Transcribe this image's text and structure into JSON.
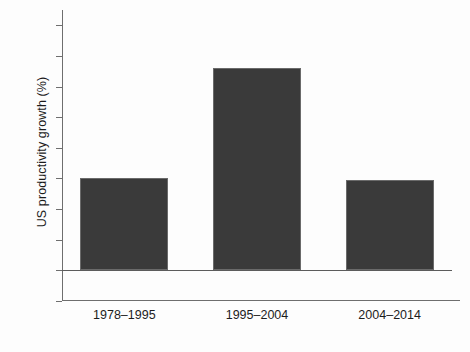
{
  "chart_data": {
    "type": "bar",
    "title": "",
    "subtitle": "",
    "xlabel": "",
    "ylabel": "US productivity growth (%)",
    "categories": [
      "1978–1995",
      "1995–2004",
      "2004–2014"
    ],
    "values": [
      1.5,
      3.3,
      1.47
    ],
    "series": [
      {
        "name": "US productivity growth",
        "values": [
          1.5,
          3.3,
          1.47
        ]
      }
    ],
    "ylim": [
      -0.5,
      4.25
    ],
    "yticks": [
      -0.5,
      0,
      0.5,
      1,
      1.5,
      2,
      2.5,
      3,
      3.5,
      4
    ],
    "ytick_labels": [
      "−0.5",
      "0",
      "0.5",
      "1",
      "1.5",
      "2",
      "2.5",
      "3",
      "3.5",
      "4"
    ],
    "grid": false,
    "legend": null,
    "legend_position": "none",
    "bar_color": "#3a3a3a",
    "bar_edge_color": "#6a6a6a",
    "axis_color": "#6e6e6e",
    "background_color": "#fdfdfd",
    "zero_line": 0,
    "annotations": []
  }
}
